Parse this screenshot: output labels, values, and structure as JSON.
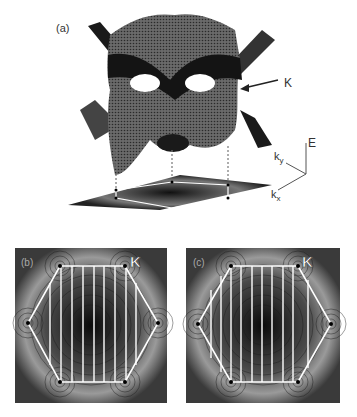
{
  "figure": {
    "panel_a": {
      "label": "(a)",
      "annotation_K": "K",
      "axes": {
        "E": "E",
        "ky": "k",
        "ky_sub": "y",
        "kx": "k",
        "kx_sub": "x"
      }
    },
    "panel_b": {
      "label": "(b)",
      "corner_label": "K",
      "cutting_lines": 9
    },
    "panel_c": {
      "label": "(c)",
      "corner_label": "K",
      "cutting_lines": 10
    }
  },
  "colors": {
    "surface": "#4a4a4a",
    "dark_band": "#111111",
    "contour_line": "#1a1a1a",
    "bz_outline": "#ffffff"
  }
}
